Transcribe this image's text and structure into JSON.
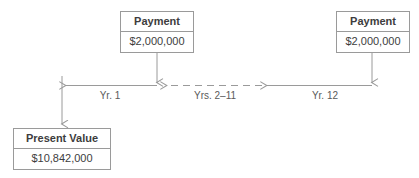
{
  "diagram": {
    "stroke_color": "#9a9a9a",
    "text_color": "#3d3d3d",
    "label_color": "#5a5a5a",
    "background_color": "#ffffff",
    "nodes": [
      {
        "id": "payment-1",
        "header": "Payment",
        "value": "$2,000,000"
      },
      {
        "id": "payment-2",
        "header": "Payment",
        "value": "$2,000,000"
      },
      {
        "id": "present-value",
        "header": "Present Value",
        "value": "$10,842,000"
      }
    ],
    "timeline": {
      "segments": [
        {
          "id": "yr-1",
          "label": "Yr. 1",
          "style": "solid"
        },
        {
          "id": "yrs-2-11",
          "label": "Yrs. 2–11",
          "style": "dashed"
        },
        {
          "id": "yr-12",
          "label": "Yr. 12",
          "style": "solid"
        }
      ]
    }
  }
}
